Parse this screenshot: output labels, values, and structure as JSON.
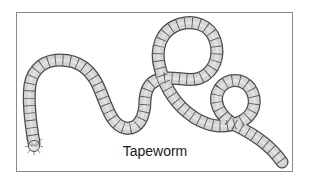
{
  "figure": {
    "caption": "Tapeworm",
    "colors": {
      "body_fill": "#d4d4d4",
      "outline": "#4a4a4a",
      "frame_border": "#8a8a8a"
    }
  }
}
